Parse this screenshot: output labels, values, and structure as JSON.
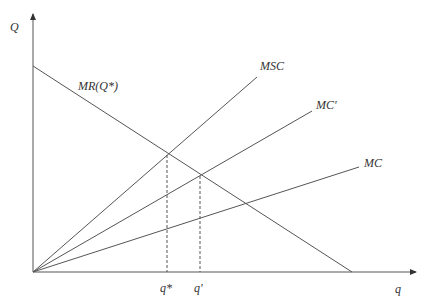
{
  "diagram": {
    "y_axis_label": "Q",
    "x_axis_label": "q",
    "curves": {
      "mr": "MR(Q*)",
      "msc": "MSC",
      "mc_prime": "MC'",
      "mc": "MC"
    },
    "ticks": {
      "q_star": "q*",
      "q_prime": "q'"
    },
    "colors": {
      "line": "#555555",
      "text": "#333333"
    }
  }
}
